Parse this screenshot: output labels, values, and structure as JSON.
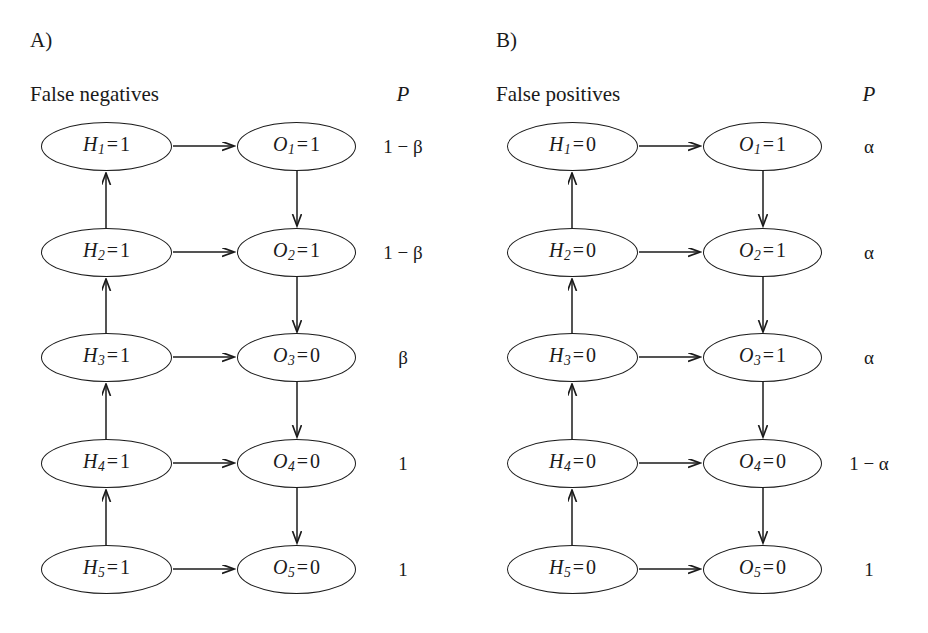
{
  "figure": {
    "background": "#ffffff",
    "stroke_color": "#1b1b1b",
    "text_color": "#1a1a1a",
    "width": 928,
    "height": 633
  },
  "panels": [
    {
      "letter": "A)",
      "caption": "False negatives",
      "p_header": "P",
      "rows": [
        {
          "hypothesis_var": "H",
          "hypothesis_sub": "1",
          "hypothesis_value": "1",
          "observation_var": "O",
          "observation_sub": "1",
          "observation_value": "1",
          "probability": "1 − β"
        },
        {
          "hypothesis_var": "H",
          "hypothesis_sub": "2",
          "hypothesis_value": "1",
          "observation_var": "O",
          "observation_sub": "2",
          "observation_value": "1",
          "probability": "1 − β"
        },
        {
          "hypothesis_var": "H",
          "hypothesis_sub": "3",
          "hypothesis_value": "1",
          "observation_var": "O",
          "observation_sub": "3",
          "observation_value": "0",
          "probability": "β"
        },
        {
          "hypothesis_var": "H",
          "hypothesis_sub": "4",
          "hypothesis_value": "1",
          "observation_var": "O",
          "observation_sub": "4",
          "observation_value": "0",
          "probability": "1"
        },
        {
          "hypothesis_var": "H",
          "hypothesis_sub": "5",
          "hypothesis_value": "1",
          "observation_var": "O",
          "observation_sub": "5",
          "observation_value": "0",
          "probability": "1"
        }
      ]
    },
    {
      "letter": "B)",
      "caption": "False positives",
      "p_header": "P",
      "rows": [
        {
          "hypothesis_var": "H",
          "hypothesis_sub": "1",
          "hypothesis_value": "0",
          "observation_var": "O",
          "observation_sub": "1",
          "observation_value": "1",
          "probability": "α"
        },
        {
          "hypothesis_var": "H",
          "hypothesis_sub": "2",
          "hypothesis_value": "0",
          "observation_var": "O",
          "observation_sub": "2",
          "observation_value": "1",
          "probability": "α"
        },
        {
          "hypothesis_var": "H",
          "hypothesis_sub": "3",
          "hypothesis_value": "0",
          "observation_var": "O",
          "observation_sub": "3",
          "observation_value": "1",
          "probability": "α"
        },
        {
          "hypothesis_var": "H",
          "hypothesis_sub": "4",
          "hypothesis_value": "0",
          "observation_var": "O",
          "observation_sub": "4",
          "observation_value": "0",
          "probability": "1 − α"
        },
        {
          "hypothesis_var": "H",
          "hypothesis_sub": "5",
          "hypothesis_value": "0",
          "observation_var": "O",
          "observation_sub": "5",
          "observation_value": "0",
          "probability": "1"
        }
      ]
    }
  ],
  "layout": {
    "row_centers": [
      146,
      252,
      357,
      463,
      569
    ],
    "h_node_center_x": 106,
    "o_node_center_x": 296,
    "edges": {
      "horizontal_direction": "H-to-O",
      "hypothesis_chain_direction": "upward",
      "observation_chain_direction": "downward"
    }
  }
}
